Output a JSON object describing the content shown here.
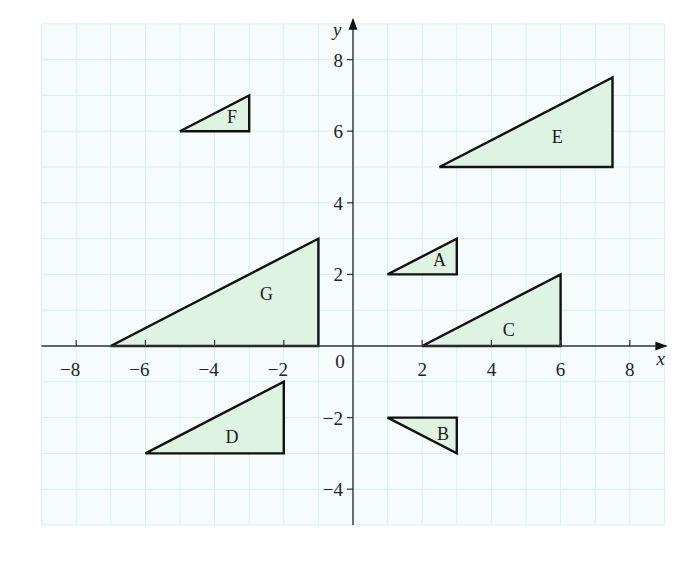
{
  "chart_data": {
    "type": "scatter",
    "subtype": "coordinate-grid-shapes",
    "title": "",
    "xlabel": "x",
    "ylabel": "y",
    "xlim": [
      -9,
      9
    ],
    "ylim": [
      -5,
      9
    ],
    "grid": true,
    "grid_step": 1,
    "x_ticks": [
      -8,
      -6,
      -4,
      -2,
      2,
      4,
      6,
      8
    ],
    "y_ticks": [
      -4,
      -2,
      2,
      4,
      6,
      8
    ],
    "origin_label": "0",
    "shapes": [
      {
        "name": "A",
        "vertices": [
          [
            1,
            2
          ],
          [
            3,
            2
          ],
          [
            3,
            3
          ]
        ],
        "label_pos": [
          2.5,
          2.4
        ]
      },
      {
        "name": "B",
        "vertices": [
          [
            1,
            -2
          ],
          [
            3,
            -2
          ],
          [
            3,
            -3
          ]
        ],
        "label_pos": [
          2.6,
          -2.45
        ]
      },
      {
        "name": "C",
        "vertices": [
          [
            2,
            0
          ],
          [
            6,
            0
          ],
          [
            6,
            2
          ]
        ],
        "label_pos": [
          4.5,
          0.45
        ]
      },
      {
        "name": "D",
        "vertices": [
          [
            -6,
            -3
          ],
          [
            -2,
            -3
          ],
          [
            -2,
            -1
          ]
        ],
        "label_pos": [
          -3.5,
          -2.55
        ]
      },
      {
        "name": "E",
        "vertices": [
          [
            2.5,
            5
          ],
          [
            7.5,
            5
          ],
          [
            7.5,
            7.5
          ]
        ],
        "label_pos": [
          5.9,
          5.85
        ]
      },
      {
        "name": "F",
        "vertices": [
          [
            -5,
            6
          ],
          [
            -3,
            6
          ],
          [
            -3,
            7
          ]
        ],
        "label_pos": [
          -3.5,
          6.4
        ]
      },
      {
        "name": "G",
        "vertices": [
          [
            -7,
            0
          ],
          [
            -1,
            0
          ],
          [
            -1,
            3
          ]
        ],
        "label_pos": [
          -2.5,
          1.45
        ]
      }
    ],
    "fill_color": "#dff3e3",
    "stroke_color": "#111111",
    "grid_color": "#d6f0f0",
    "grid_bg": "#f6fcfc"
  },
  "figure": {
    "origin_px": [
      353,
      346
    ],
    "unit_px": [
      34.6,
      35.8
    ]
  }
}
